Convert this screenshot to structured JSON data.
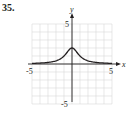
{
  "problem": {
    "number": "35."
  },
  "chart_data": {
    "type": "line",
    "title": "",
    "xlabel": "x",
    "ylabel": "y",
    "xlim": [
      -5,
      5
    ],
    "ylim": [
      -5,
      5
    ],
    "grid": true,
    "x_tick_labels": [
      "-5",
      "5"
    ],
    "y_tick_labels": [
      "5",
      "-5"
    ],
    "series": [
      {
        "name": "f(x)",
        "x": [
          -5,
          -4,
          -3,
          -2,
          -1,
          -0.5,
          0,
          0.5,
          1,
          2,
          3,
          4,
          5
        ],
        "y": [
          0.08,
          0.12,
          0.2,
          0.4,
          1.0,
          1.6,
          2.0,
          1.6,
          1.0,
          0.4,
          0.2,
          0.12,
          0.08
        ]
      }
    ],
    "colors": {
      "grid": "#d9d9d9",
      "axes": "#231f20",
      "curve": "#231f20"
    }
  }
}
